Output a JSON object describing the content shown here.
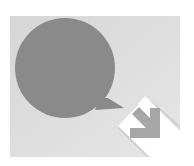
{
  "icon": {
    "name": "chat-reply-icon",
    "colors": {
      "page_background": "#ffffff",
      "tile_background": "#d9d9d9",
      "tile_highlight": "#e4e4e4",
      "bubble": "#8a8a8a",
      "white_band": "#ffffff",
      "arrow": "#a6a6a6",
      "shadow": "#bdbdbd"
    }
  }
}
